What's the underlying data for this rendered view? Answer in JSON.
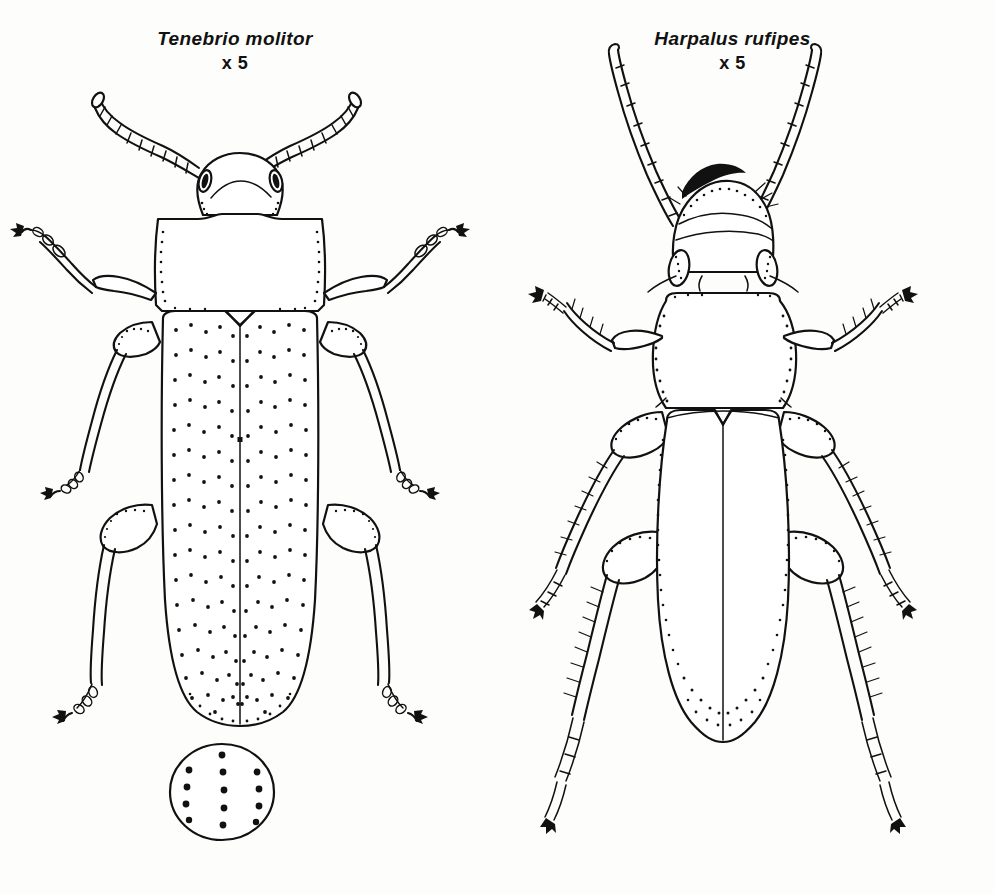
{
  "plate": {
    "background_color": "#fdfdfb",
    "ink_color": "#111111",
    "figure_count": 2
  },
  "figures": [
    {
      "id": "tenebrio",
      "species_label": "Tenebrio molitor",
      "magnification_label": "x 5",
      "common_context": "mealworm beetle, dorsal view",
      "antenna_type": "moniliform",
      "elytra_texture": "rows of punctures",
      "inset": {
        "label": "",
        "shape": "circle",
        "content": "magnified elytral punctures",
        "rows": 3,
        "dots_per_row": [
          7,
          6,
          6
        ]
      }
    },
    {
      "id": "harpalus",
      "species_label": "Harpalus rufipes",
      "magnification_label": "x 5",
      "common_context": "strawberry seed beetle, dorsal view",
      "antenna_type": "filiform",
      "elytra_texture": "smooth with stippled margins",
      "legs": "spined femora and tibiae"
    }
  ]
}
